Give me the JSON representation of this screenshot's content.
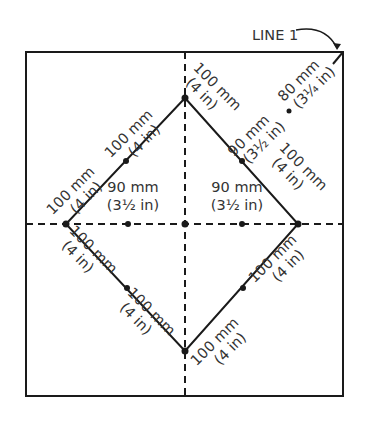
{
  "diagram": {
    "title_label": "LINE 1",
    "colors": {
      "line": "#1a1a1a",
      "text": "#333333",
      "background": "#ffffff"
    },
    "frame": {
      "x": 26,
      "y": 52,
      "width": 317,
      "height": 344
    },
    "center": {
      "x": 185,
      "y": 224
    },
    "diamond": {
      "top": [
        185,
        98
      ],
      "right": [
        298,
        224
      ],
      "bottom": [
        185,
        351
      ],
      "left": [
        66,
        224
      ]
    },
    "labels": {
      "upper_left_outer": {
        "mm": "100 mm",
        "in": "(4 in)"
      },
      "upper_left_inner": {
        "mm": "100 mm",
        "in": "(4 in)"
      },
      "upper_right_outer": {
        "mm": "100 mm",
        "in": "(4 in)"
      },
      "upper_right_inner": {
        "mm": "90 mm",
        "in": "(3½ in)"
      },
      "right_edge": {
        "mm": "100 mm",
        "in": "(4 in)"
      },
      "corner_diag": {
        "mm": "80 mm",
        "in": "(3¼ in)"
      },
      "center_left": {
        "mm": "90 mm",
        "in": "(3½ in)"
      },
      "center_right": {
        "mm": "90 mm",
        "in": "(3½ in)"
      },
      "lower_left_outer": {
        "mm": "100 mm",
        "in": "(4 in)"
      },
      "lower_left_inner": {
        "mm": "100 mm",
        "in": "(4 in)"
      },
      "lower_right_outer": {
        "mm": "100 mm",
        "in": "(4 in)"
      },
      "lower_right_inner": {
        "mm": "100 mm",
        "in": "(4 in)"
      }
    }
  }
}
